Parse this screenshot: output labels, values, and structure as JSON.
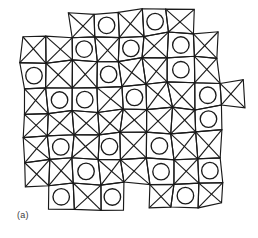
{
  "figure": {
    "caption": "(a)",
    "kind": "structural-tiling-diagram",
    "background_color": "#ffffff",
    "line_color": "#1a1a1a",
    "circle_color": "#1a1a1a",
    "line_width": 1.15,
    "circle_line_width": 1.35,
    "canvas": {
      "width": 258,
      "height": 238
    },
    "lattice": {
      "origin_x": 20.0,
      "origin_y": 14.0,
      "cell": 24.6,
      "columns": 9,
      "rows": 8,
      "global_rotation_deg": -1.6,
      "jitter_seed": 20247,
      "jitter_amount": 2.45,
      "note": "Vertices of the square net are randomly displaced to give the disordered look."
    },
    "tiles": [
      {
        "col": 0,
        "row": 0,
        "type": "none"
      },
      {
        "col": 1,
        "row": 0,
        "type": "none"
      },
      {
        "col": 2,
        "row": 0,
        "type": "cross"
      },
      {
        "col": 3,
        "row": 0,
        "type": "circle"
      },
      {
        "col": 4,
        "row": 0,
        "type": "cross"
      },
      {
        "col": 5,
        "row": 0,
        "type": "circle"
      },
      {
        "col": 6,
        "row": 0,
        "type": "cross"
      },
      {
        "col": 7,
        "row": 0,
        "type": "none"
      },
      {
        "col": 8,
        "row": 0,
        "type": "none"
      },
      {
        "col": 0,
        "row": 1,
        "type": "cross"
      },
      {
        "col": 1,
        "row": 1,
        "type": "cross"
      },
      {
        "col": 2,
        "row": 1,
        "type": "circle"
      },
      {
        "col": 3,
        "row": 1,
        "type": "cross"
      },
      {
        "col": 4,
        "row": 1,
        "type": "circle"
      },
      {
        "col": 5,
        "row": 1,
        "type": "cross"
      },
      {
        "col": 6,
        "row": 1,
        "type": "circle"
      },
      {
        "col": 7,
        "row": 1,
        "type": "cross"
      },
      {
        "col": 8,
        "row": 1,
        "type": "none"
      },
      {
        "col": 0,
        "row": 2,
        "type": "circle"
      },
      {
        "col": 1,
        "row": 2,
        "type": "cross"
      },
      {
        "col": 2,
        "row": 2,
        "type": "cross"
      },
      {
        "col": 3,
        "row": 2,
        "type": "circle"
      },
      {
        "col": 4,
        "row": 2,
        "type": "cross"
      },
      {
        "col": 5,
        "row": 2,
        "type": "cross"
      },
      {
        "col": 6,
        "row": 2,
        "type": "circle"
      },
      {
        "col": 7,
        "row": 2,
        "type": "cross"
      },
      {
        "col": 8,
        "row": 2,
        "type": "none"
      },
      {
        "col": 0,
        "row": 3,
        "type": "cross"
      },
      {
        "col": 1,
        "row": 3,
        "type": "circle"
      },
      {
        "col": 2,
        "row": 3,
        "type": "circle"
      },
      {
        "col": 3,
        "row": 3,
        "type": "cross"
      },
      {
        "col": 4,
        "row": 3,
        "type": "circle"
      },
      {
        "col": 5,
        "row": 3,
        "type": "cross"
      },
      {
        "col": 6,
        "row": 3,
        "type": "cross"
      },
      {
        "col": 7,
        "row": 3,
        "type": "circle"
      },
      {
        "col": 8,
        "row": 3,
        "type": "cross"
      },
      {
        "col": 0,
        "row": 4,
        "type": "cross"
      },
      {
        "col": 1,
        "row": 4,
        "type": "cross"
      },
      {
        "col": 2,
        "row": 4,
        "type": "cross"
      },
      {
        "col": 3,
        "row": 4,
        "type": "cross"
      },
      {
        "col": 4,
        "row": 4,
        "type": "cross"
      },
      {
        "col": 5,
        "row": 4,
        "type": "cross"
      },
      {
        "col": 6,
        "row": 4,
        "type": "cross"
      },
      {
        "col": 7,
        "row": 4,
        "type": "circle"
      },
      {
        "col": 8,
        "row": 4,
        "type": "none"
      },
      {
        "col": 0,
        "row": 5,
        "type": "cross"
      },
      {
        "col": 1,
        "row": 5,
        "type": "circle"
      },
      {
        "col": 2,
        "row": 5,
        "type": "cross"
      },
      {
        "col": 3,
        "row": 5,
        "type": "circle"
      },
      {
        "col": 4,
        "row": 5,
        "type": "cross"
      },
      {
        "col": 5,
        "row": 5,
        "type": "circle"
      },
      {
        "col": 6,
        "row": 5,
        "type": "cross"
      },
      {
        "col": 7,
        "row": 5,
        "type": "cross"
      },
      {
        "col": 8,
        "row": 5,
        "type": "none"
      },
      {
        "col": 0,
        "row": 6,
        "type": "cross"
      },
      {
        "col": 1,
        "row": 6,
        "type": "cross"
      },
      {
        "col": 2,
        "row": 6,
        "type": "circle"
      },
      {
        "col": 3,
        "row": 6,
        "type": "cross"
      },
      {
        "col": 4,
        "row": 6,
        "type": "cross"
      },
      {
        "col": 5,
        "row": 6,
        "type": "circle"
      },
      {
        "col": 6,
        "row": 6,
        "type": "cross"
      },
      {
        "col": 7,
        "row": 6,
        "type": "circle"
      },
      {
        "col": 8,
        "row": 6,
        "type": "none"
      },
      {
        "col": 0,
        "row": 7,
        "type": "none"
      },
      {
        "col": 1,
        "row": 7,
        "type": "circle"
      },
      {
        "col": 2,
        "row": 7,
        "type": "cross"
      },
      {
        "col": 3,
        "row": 7,
        "type": "circle"
      },
      {
        "col": 4,
        "row": 7,
        "type": "none"
      },
      {
        "col": 5,
        "row": 7,
        "type": "cross"
      },
      {
        "col": 6,
        "row": 7,
        "type": "circle"
      },
      {
        "col": 7,
        "row": 7,
        "type": "cross"
      },
      {
        "col": 8,
        "row": 7,
        "type": "none"
      }
    ],
    "circle_radius_ratio": 0.335
  }
}
